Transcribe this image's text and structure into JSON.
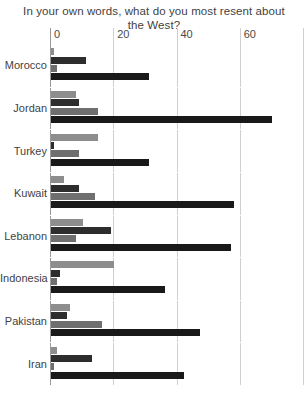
{
  "chart_data": {
    "type": "bar",
    "orientation": "horizontal",
    "title": "In your own words, what do you most resent about the West?",
    "xlabel": "",
    "ylabel": "",
    "xlim": [
      0,
      80
    ],
    "xticks": [
      0,
      20,
      40,
      60,
      80
    ],
    "xtick_labels": [
      "0",
      "20",
      "40",
      "60",
      "8"
    ],
    "grid": true,
    "legend": "none",
    "categories": [
      "Morocco",
      "Jordan",
      "Turkey",
      "Kuwait",
      "Lebanon",
      "Indonesia",
      "Pakistan",
      "Iran"
    ],
    "series": [
      {
        "name": "series-1",
        "color": "#8d8d8d",
        "values": [
          1,
          8,
          15,
          4,
          10,
          20,
          6,
          2
        ]
      },
      {
        "name": "series-2",
        "color": "#2d2d2d",
        "values": [
          11,
          9,
          1,
          9,
          19,
          3,
          5,
          13
        ]
      },
      {
        "name": "series-3",
        "color": "#6f6f6f",
        "values": [
          2,
          15,
          9,
          14,
          8,
          2,
          16,
          1
        ]
      },
      {
        "name": "series-4",
        "color": "#191919",
        "values": [
          31,
          70,
          31,
          58,
          57,
          36,
          47,
          42
        ]
      }
    ]
  },
  "colors": {
    "background": "#ffffff",
    "gridline": "#cfcfcf",
    "axis": "#9a9a9a",
    "text": "#3f3f3f"
  }
}
